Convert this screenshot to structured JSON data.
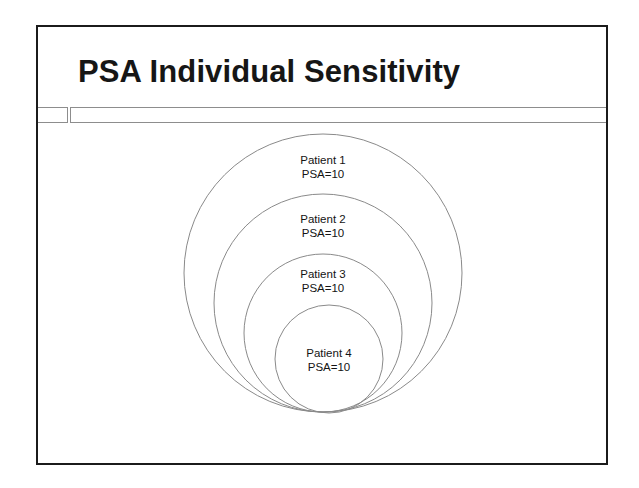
{
  "slide": {
    "title": "PSA Individual Sensitivity",
    "background_color": "#ffffff",
    "border_color": "#1b1b1b",
    "text_color": "#161616",
    "divider_color": "#8d8d8d"
  },
  "diagram": {
    "type": "nested-tangent-circles",
    "stroke_color": "#8a8a8a",
    "fill": "none",
    "tangent_point": {
      "x": 321,
      "y": 410
    },
    "circles": [
      {
        "id": "patient-1",
        "name": "Patient 1",
        "value": "PSA=10",
        "center": {
          "x": 321,
          "y": 271
        },
        "radius": 139,
        "label_position": {
          "x": 321,
          "y": 158
        }
      },
      {
        "id": "patient-2",
        "name": "Patient 2",
        "value": "PSA=10",
        "center": {
          "x": 321,
          "y": 301
        },
        "radius": 109,
        "label_position": {
          "x": 321,
          "y": 217
        }
      },
      {
        "id": "patient-3",
        "name": "Patient 3",
        "value": "PSA=10",
        "center": {
          "x": 321,
          "y": 331
        },
        "radius": 79,
        "label_position": {
          "x": 321,
          "y": 272
        }
      },
      {
        "id": "patient-4",
        "name": "Patient 4",
        "value": "PSA=10",
        "center": {
          "x": 327,
          "y": 357
        },
        "radius": 54,
        "label_position": {
          "x": 327,
          "y": 351
        }
      }
    ]
  }
}
